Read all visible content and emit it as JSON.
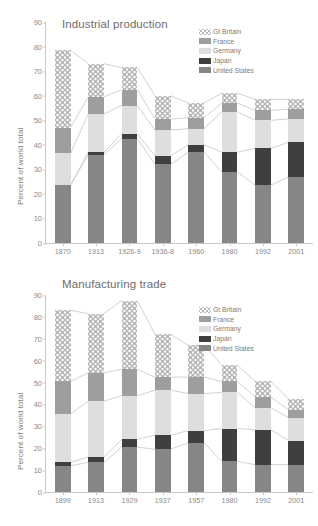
{
  "figure": {
    "ylabel": "Percent of world total",
    "series_names": [
      "Gt Britain",
      "France",
      "Germany",
      "Japan",
      "United States"
    ],
    "colors": {
      "gt_britain": "#b9b9b9",
      "france": "#9e9e9e",
      "germany": "#dedede",
      "japan": "#3f3f3f",
      "united_states": "#868686",
      "axis": "#c8c8c8",
      "text": "#7d7d7d"
    }
  },
  "legend": {
    "items": [
      {
        "label": "Gt Britain",
        "key": "gb"
      },
      {
        "label": "France",
        "key": "france"
      },
      {
        "label": "Germany",
        "key": "germany"
      },
      {
        "label": "Japan",
        "key": "japan"
      },
      {
        "label": "United States",
        "key": "us"
      }
    ]
  },
  "chart_data": [
    {
      "id": "industrial-production",
      "type": "bar",
      "stacked": true,
      "title": "Industrial production",
      "xlabel": "",
      "ylabel": "Percent of world total",
      "ylim": [
        0,
        90
      ],
      "yticks": [
        0,
        10,
        20,
        30,
        40,
        50,
        60,
        70,
        80,
        90
      ],
      "grid": false,
      "legend_position": "top-right",
      "categories": [
        "1870",
        "1913",
        "1926-9",
        "1936-8",
        "1960",
        "1980",
        "1992",
        "2001"
      ],
      "series": [
        {
          "name": "United States",
          "values": [
            23.5,
            36.0,
            42.5,
            32.0,
            37.0,
            29.0,
            23.5,
            27.0
          ]
        },
        {
          "name": "Japan",
          "values": [
            0.0,
            1.0,
            2.0,
            3.5,
            3.0,
            8.0,
            15.0,
            14.0
          ]
        },
        {
          "name": "Germany",
          "values": [
            13.0,
            15.5,
            11.5,
            10.5,
            6.5,
            16.5,
            11.5,
            9.5
          ]
        },
        {
          "name": "France",
          "values": [
            10.5,
            7.0,
            6.5,
            4.5,
            4.5,
            3.5,
            4.0,
            4.0
          ]
        },
        {
          "name": "Gt Britain",
          "values": [
            31.5,
            13.5,
            9.0,
            9.5,
            6.0,
            4.0,
            4.5,
            4.0
          ]
        }
      ],
      "totals": [
        78.5,
        73.0,
        71.5,
        60.0,
        57.0,
        61.0,
        58.5,
        58.5
      ]
    },
    {
      "id": "manufacturing-trade",
      "type": "bar",
      "stacked": true,
      "title": "Manufacturing trade",
      "xlabel": "",
      "ylabel": "Percent of world total",
      "ylim": [
        0,
        90
      ],
      "yticks": [
        0,
        10,
        20,
        30,
        40,
        50,
        60,
        70,
        80,
        90
      ],
      "grid": false,
      "legend_position": "top-right",
      "categories": [
        "1899",
        "1913",
        "1929",
        "1937",
        "1957",
        "1980",
        "1992",
        "2001"
      ],
      "series": [
        {
          "name": "United States",
          "values": [
            12.0,
            13.5,
            20.5,
            19.5,
            22.5,
            14.0,
            12.5,
            12.5
          ]
        },
        {
          "name": "Japan",
          "values": [
            1.5,
            2.5,
            3.5,
            6.5,
            5.5,
            15.0,
            16.0,
            11.0
          ]
        },
        {
          "name": "Germany",
          "values": [
            22.0,
            25.5,
            20.0,
            20.5,
            17.0,
            16.5,
            10.0,
            10.5
          ]
        },
        {
          "name": "France",
          "values": [
            15.0,
            13.0,
            12.0,
            6.0,
            7.5,
            5.0,
            5.0,
            3.5
          ]
        },
        {
          "name": "Gt Britain",
          "values": [
            32.5,
            27.0,
            31.5,
            19.5,
            14.5,
            7.5,
            7.0,
            5.0
          ]
        }
      ],
      "totals": [
        83.0,
        81.5,
        87.5,
        72.0,
        67.0,
        58.0,
        50.5,
        42.5
      ]
    }
  ]
}
